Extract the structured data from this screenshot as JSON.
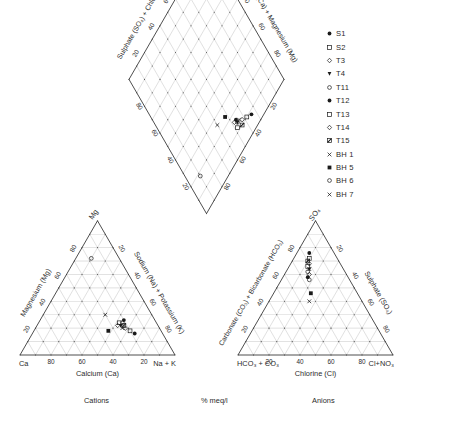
{
  "figure": {
    "type": "piper-trilinear-diagram",
    "units_label": "% meq/l",
    "cations_label": "Cations",
    "anions_label": "Anions"
  },
  "diamond": {
    "left_axis_label": "Sulphate (SO₄) + Chloride (Cl)",
    "right_axis_label": "Calcium (Ca) + Magnesium (Mg)",
    "ticks": [
      "20",
      "40",
      "60",
      "80"
    ]
  },
  "cation_triangle": {
    "apex_label": "Mg",
    "left_vertex_label": "Ca",
    "right_vertex_label": "Na + K",
    "left_axis_label": "Magnesium (Mg)",
    "right_axis_label": "Sodium (Na) + Potassium (K)",
    "bottom_axis_label": "Calcium (Ca)",
    "bottom_ticks": [
      "80",
      "60",
      "40",
      "20"
    ],
    "left_ticks": [
      "20",
      "40",
      "60",
      "80"
    ],
    "right_ticks": [
      "20",
      "40",
      "60",
      "80"
    ]
  },
  "anion_triangle": {
    "apex_label": "SO₄",
    "left_vertex_label": "HCO₃ + CO₃",
    "right_vertex_label": "Cl+NO₃",
    "left_axis_label": "Carbonate (CO₃) + Bicarbonate (HCO₃)",
    "right_axis_label": "Sulphate (SO₄)",
    "bottom_axis_label": "Chlorine (Cl)",
    "bottom_ticks": [
      "20",
      "40",
      "60",
      "80"
    ],
    "left_ticks": [
      "20",
      "40",
      "60",
      "80"
    ],
    "right_ticks": [
      "20",
      "40",
      "60",
      "80"
    ]
  },
  "legend": {
    "items": [
      {
        "label": "S1",
        "symbol": "filled-circle"
      },
      {
        "label": "S2",
        "symbol": "open-square"
      },
      {
        "label": "T3",
        "symbol": "open-diamond"
      },
      {
        "label": "T4",
        "symbol": "filled-down-triangle"
      },
      {
        "label": "T11",
        "symbol": "open-circle"
      },
      {
        "label": "T12",
        "symbol": "filled-circle"
      },
      {
        "label": "T13",
        "symbol": "open-square"
      },
      {
        "label": "T14",
        "symbol": "open-diamond"
      },
      {
        "label": "T15",
        "symbol": "filled-slash-square"
      },
      {
        "label": "BH 1",
        "symbol": "cross-x"
      },
      {
        "label": "BH 5",
        "symbol": "filled-square"
      },
      {
        "label": "BH 6",
        "symbol": "open-circle"
      },
      {
        "label": "BH 7",
        "symbol": "cross-x"
      }
    ]
  },
  "chart_data": {
    "type": "scatter",
    "title": "",
    "xlabel": "% meq/l",
    "ylabel": "",
    "series": [
      {
        "name": "S1",
        "cation": {
          "ca": 18,
          "mg": 16,
          "na_k": 66
        },
        "anion": {
          "hco3_co3": 16,
          "so4": 76,
          "cl_no3": 8
        }
      },
      {
        "name": "S2",
        "cation": {
          "ca": 20,
          "mg": 18,
          "na_k": 62
        },
        "anion": {
          "hco3_co3": 18,
          "so4": 72,
          "cl_no3": 10
        }
      },
      {
        "name": "T3",
        "cation": {
          "ca": 22,
          "mg": 20,
          "na_k": 58
        },
        "anion": {
          "hco3_co3": 20,
          "so4": 68,
          "cl_no3": 12
        }
      },
      {
        "name": "T4",
        "cation": {
          "ca": 24,
          "mg": 22,
          "na_k": 54
        },
        "anion": {
          "hco3_co3": 22,
          "so4": 64,
          "cl_no3": 14
        }
      },
      {
        "name": "T11",
        "cation": {
          "ca": 22,
          "mg": 24,
          "na_k": 54
        },
        "anion": {
          "hco3_co3": 24,
          "so4": 62,
          "cl_no3": 14
        }
      },
      {
        "name": "T12",
        "cation": {
          "ca": 20,
          "mg": 26,
          "na_k": 54
        },
        "anion": {
          "hco3_co3": 26,
          "so4": 58,
          "cl_no3": 16
        }
      },
      {
        "name": "T13",
        "cation": {
          "ca": 24,
          "mg": 24,
          "na_k": 52
        },
        "anion": {
          "hco3_co3": 22,
          "so4": 66,
          "cl_no3": 12
        }
      },
      {
        "name": "T14",
        "cation": {
          "ca": 26,
          "mg": 22,
          "na_k": 52
        },
        "anion": {
          "hco3_co3": 24,
          "so4": 60,
          "cl_no3": 16
        }
      },
      {
        "name": "T15",
        "cation": {
          "ca": 22,
          "mg": 22,
          "na_k": 56
        },
        "anion": {
          "hco3_co3": 20,
          "so4": 70,
          "cl_no3": 10
        }
      },
      {
        "name": "BH 1",
        "cation": {
          "ca": 30,
          "mg": 30,
          "na_k": 40
        },
        "anion": {
          "hco3_co3": 34,
          "so4": 40,
          "cl_no3": 26
        }
      },
      {
        "name": "BH 5",
        "cation": {
          "ca": 34,
          "mg": 18,
          "na_k": 48
        },
        "anion": {
          "hco3_co3": 30,
          "so4": 46,
          "cl_no3": 24
        }
      },
      {
        "name": "BH 6",
        "cation": {
          "ca": 18,
          "mg": 72,
          "na_k": 10
        },
        "anion": {
          "hco3_co3": 26,
          "so4": 56,
          "cl_no3": 18
        }
      },
      {
        "name": "BH 7",
        "cation": {
          "ca": 24,
          "mg": 20,
          "na_k": 56
        },
        "anion": {
          "hco3_co3": 22,
          "so4": 64,
          "cl_no3": 14
        }
      }
    ]
  },
  "colors": {
    "grid": "#9b9b9b",
    "axis": "#3a3a3a",
    "text": "#2b2b2b",
    "marker": "#1a1a1a"
  }
}
